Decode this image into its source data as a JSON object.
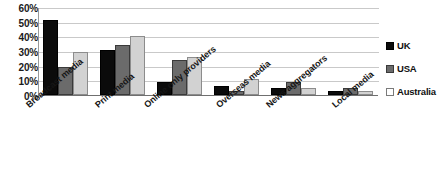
{
  "chart_data": {
    "type": "bar",
    "title": "",
    "xlabel": "",
    "ylabel": "",
    "ylim": [
      0,
      60
    ],
    "yticks": [
      "0%",
      "10%",
      "20%",
      "30%",
      "40%",
      "50%",
      "60%"
    ],
    "ytick_values": [
      0,
      10,
      20,
      30,
      40,
      50,
      60
    ],
    "grid": true,
    "legend_position": "right",
    "categories": [
      "Broadcast media",
      "Print media",
      "Online only providers",
      "Overseas media",
      "News aggregators",
      "Local media"
    ],
    "series": [
      {
        "name": "UK",
        "color": "#0b0b0b",
        "values": [
          51,
          31,
          9,
          6,
          5,
          3
        ]
      },
      {
        "name": "USA",
        "color": "#6b6b6b",
        "values": [
          19,
          34,
          24,
          3,
          9,
          5
        ]
      },
      {
        "name": "Australia",
        "color": "#d2d2d2",
        "values": [
          29,
          40,
          26,
          11,
          5,
          3
        ]
      }
    ]
  },
  "legend": {
    "items": [
      {
        "label": "UK"
      },
      {
        "label": "USA"
      },
      {
        "label": "Australia"
      }
    ]
  }
}
